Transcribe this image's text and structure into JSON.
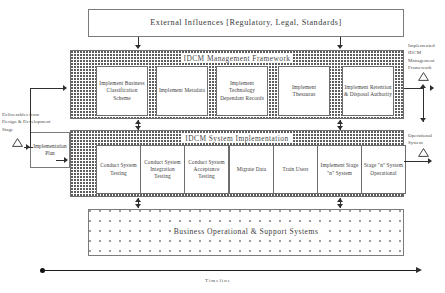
{
  "diagram": {
    "title_fragment": "",
    "external_influences": {
      "label": "External Influences [Regulatory, Legal, Standards]"
    },
    "management_framework": {
      "band_label": "IDCM Management Framework",
      "tasks": [
        {
          "label": "Implement Business Classification Scheme"
        },
        {
          "label": "Implement Metadata"
        },
        {
          "label": "Implement Technology Dependant Records"
        },
        {
          "label": "Implement Thesaurus"
        },
        {
          "label": "Implement Retention & Disposal Authority"
        }
      ]
    },
    "system_implementation": {
      "band_label": "IDCM System Implementation",
      "tasks": [
        {
          "label": "Conduct System Testing"
        },
        {
          "label": "Conduct System Integration Testing"
        },
        {
          "label": "Conduct System Acceptance Testing"
        },
        {
          "label": "Migrate Data"
        },
        {
          "label": "Train Users"
        },
        {
          "label": "Implement Stage \"n\" System"
        },
        {
          "label": "Stage \"n\" System Operational"
        }
      ]
    },
    "support_systems": {
      "label": "Business Operational & Support Systems"
    },
    "inputs": {
      "deliverables_note": "Deliverables from Design & Development Stage",
      "implementation_plan": "Implementation Plan"
    },
    "outputs": {
      "framework_milestone": "Implemented IDCM Management Framework",
      "system_milestone": "Operational System"
    },
    "timeline": {
      "label": "Timeline"
    }
  }
}
